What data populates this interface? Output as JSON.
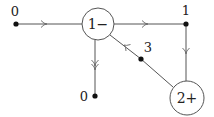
{
  "diagram": {
    "nodes": [
      {
        "id": "v0_left",
        "type": "dot",
        "label": "0",
        "x": 16,
        "y": 24
      },
      {
        "id": "n1_minus",
        "type": "circle",
        "label": "1−",
        "x": 98,
        "y": 24
      },
      {
        "id": "v1",
        "type": "dot",
        "label": "1",
        "x": 186,
        "y": 24
      },
      {
        "id": "v3",
        "type": "dot",
        "label": "3",
        "x": 141,
        "y": 59
      },
      {
        "id": "v0_bottom",
        "type": "dot",
        "label": "0",
        "x": 95,
        "y": 96
      },
      {
        "id": "n2_plus",
        "type": "circle",
        "label": "2+",
        "x": 187,
        "y": 98
      }
    ],
    "edges": [
      {
        "from": "v0_left",
        "to": "n1_minus",
        "arrow": "single",
        "direction": "right"
      },
      {
        "from": "n1_minus",
        "to": "v1",
        "arrow": "single",
        "direction": "right"
      },
      {
        "from": "v1",
        "to": "n2_plus",
        "arrow": "single",
        "direction": "down"
      },
      {
        "from": "n2_plus",
        "to": "v3",
        "arrow": "none"
      },
      {
        "from": "v3",
        "to": "n1_minus",
        "arrow": "single",
        "direction": "up-left"
      },
      {
        "from": "n1_minus",
        "to": "v0_bottom",
        "arrow": "double",
        "direction": "down"
      }
    ],
    "labels": {
      "left_zero": "0",
      "node_one_minus": "1−",
      "top_right_one": "1",
      "three": "3",
      "bottom_zero": "0",
      "node_two_plus": "2+"
    }
  }
}
